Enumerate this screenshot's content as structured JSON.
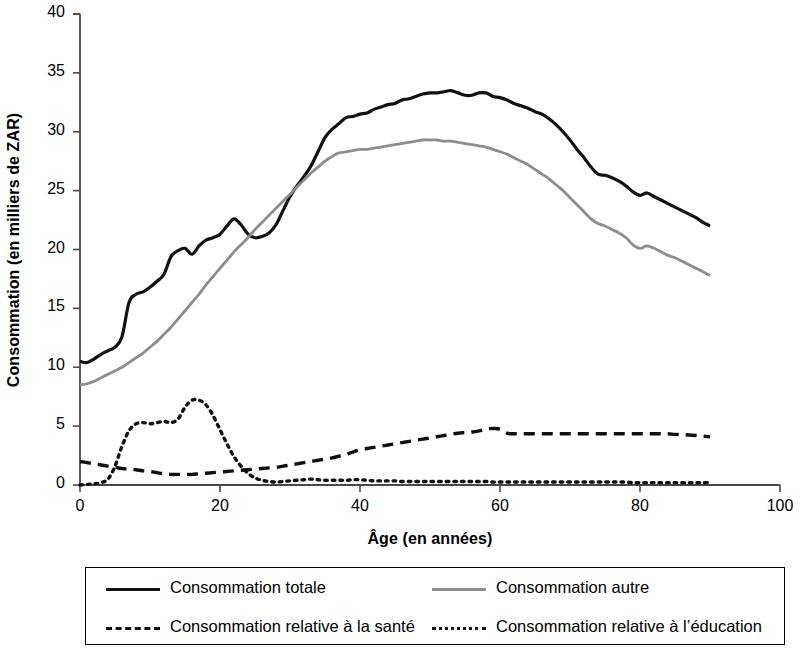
{
  "chart_data": {
    "type": "line",
    "title": "",
    "xlabel": "Âge (en années)",
    "ylabel": "Consommation (en milliers de ZAR)",
    "xlim": [
      0,
      100
    ],
    "ylim": [
      0,
      40
    ],
    "xticks": [
      0,
      20,
      40,
      60,
      80,
      100
    ],
    "yticks": [
      0,
      5,
      10,
      15,
      20,
      25,
      30,
      35,
      40
    ],
    "xtick_labels": [
      "0",
      "20",
      "40",
      "60",
      "80",
      "100"
    ],
    "ytick_labels": [
      "0",
      "5",
      "10",
      "15",
      "20",
      "25",
      "30",
      "35",
      "40"
    ],
    "grid": false,
    "legend_position": "below-axes",
    "x": [
      0,
      1,
      2,
      3,
      4,
      5,
      6,
      7,
      8,
      9,
      10,
      11,
      12,
      13,
      14,
      15,
      16,
      17,
      18,
      19,
      20,
      21,
      22,
      23,
      24,
      25,
      26,
      27,
      28,
      29,
      30,
      31,
      32,
      33,
      34,
      35,
      36,
      37,
      38,
      39,
      40,
      41,
      42,
      43,
      44,
      45,
      46,
      47,
      48,
      49,
      50,
      51,
      52,
      53,
      54,
      55,
      56,
      57,
      58,
      59,
      60,
      61,
      62,
      63,
      64,
      65,
      66,
      67,
      68,
      69,
      70,
      71,
      72,
      73,
      74,
      75,
      76,
      77,
      78,
      79,
      80,
      81,
      82,
      83,
      84,
      85,
      86,
      87,
      88,
      89,
      90
    ],
    "series": [
      {
        "name": "Consommation totale",
        "style": "solid",
        "color": "#111111",
        "values": [
          10.5,
          10.4,
          10.7,
          11.1,
          11.4,
          11.7,
          12.6,
          15.5,
          16.2,
          16.4,
          16.8,
          17.3,
          17.9,
          19.4,
          19.9,
          20.1,
          19.6,
          20.3,
          20.8,
          21.0,
          21.3,
          22.0,
          22.6,
          22.1,
          21.3,
          21.0,
          21.1,
          21.4,
          22.1,
          23.3,
          24.5,
          25.4,
          26.2,
          27.1,
          28.3,
          29.5,
          30.2,
          30.7,
          31.2,
          31.3,
          31.5,
          31.6,
          31.9,
          32.1,
          32.3,
          32.4,
          32.7,
          32.8,
          33.0,
          33.2,
          33.3,
          33.3,
          33.4,
          33.5,
          33.3,
          33.1,
          33.1,
          33.3,
          33.3,
          33.0,
          32.9,
          32.7,
          32.4,
          32.2,
          32.0,
          31.7,
          31.5,
          31.1,
          30.6,
          30.0,
          29.3,
          28.5,
          27.8,
          27.0,
          26.4,
          26.3,
          26.1,
          25.8,
          25.4,
          24.9,
          24.6,
          24.8,
          24.5,
          24.2,
          23.9,
          23.6,
          23.3,
          23.0,
          22.7,
          22.3,
          22.0
        ]
      },
      {
        "name": "Consommation autre",
        "style": "solid",
        "color": "#8d8d8d",
        "values": [
          8.5,
          8.6,
          8.8,
          9.1,
          9.4,
          9.7,
          10.0,
          10.4,
          10.8,
          11.2,
          11.7,
          12.2,
          12.8,
          13.4,
          14.1,
          14.8,
          15.5,
          16.2,
          17.0,
          17.7,
          18.4,
          19.1,
          19.8,
          20.4,
          21.0,
          21.7,
          22.3,
          22.9,
          23.5,
          24.1,
          24.7,
          25.3,
          25.9,
          26.5,
          27.0,
          27.5,
          27.9,
          28.2,
          28.3,
          28.4,
          28.5,
          28.5,
          28.6,
          28.7,
          28.8,
          28.9,
          29.0,
          29.1,
          29.2,
          29.3,
          29.3,
          29.3,
          29.2,
          29.2,
          29.1,
          29.0,
          28.9,
          28.8,
          28.7,
          28.5,
          28.3,
          28.1,
          27.8,
          27.5,
          27.2,
          26.8,
          26.4,
          26.0,
          25.5,
          25.0,
          24.4,
          23.8,
          23.2,
          22.6,
          22.2,
          22.0,
          21.7,
          21.4,
          21.0,
          20.4,
          20.1,
          20.3,
          20.1,
          19.8,
          19.5,
          19.3,
          19.0,
          18.7,
          18.4,
          18.1,
          17.8
        ]
      },
      {
        "name": "Consommation relative à la santé",
        "style": "dashed",
        "color": "#111111",
        "values": [
          2.0,
          1.9,
          1.8,
          1.7,
          1.6,
          1.5,
          1.4,
          1.35,
          1.3,
          1.2,
          1.15,
          1.05,
          0.95,
          0.9,
          0.9,
          0.9,
          0.9,
          0.95,
          1.0,
          1.05,
          1.1,
          1.15,
          1.2,
          1.25,
          1.3,
          1.35,
          1.4,
          1.45,
          1.5,
          1.6,
          1.7,
          1.8,
          1.9,
          2.0,
          2.1,
          2.2,
          2.3,
          2.45,
          2.6,
          2.8,
          3.0,
          3.1,
          3.2,
          3.3,
          3.4,
          3.5,
          3.6,
          3.7,
          3.8,
          3.9,
          4.0,
          4.1,
          4.2,
          4.3,
          4.4,
          4.45,
          4.5,
          4.6,
          4.75,
          4.8,
          4.75,
          4.4,
          4.35,
          4.35,
          4.35,
          4.35,
          4.35,
          4.35,
          4.35,
          4.35,
          4.35,
          4.35,
          4.35,
          4.35,
          4.35,
          4.35,
          4.35,
          4.35,
          4.35,
          4.35,
          4.35,
          4.35,
          4.35,
          4.35,
          4.35,
          4.3,
          4.3,
          4.25,
          4.2,
          4.15,
          4.1
        ]
      },
      {
        "name": "Consommation relative à l’éducation",
        "style": "dotted",
        "color": "#111111",
        "values": [
          0.0,
          0.05,
          0.1,
          0.2,
          0.5,
          1.6,
          3.3,
          4.6,
          5.2,
          5.3,
          5.2,
          5.3,
          5.4,
          5.3,
          5.6,
          6.6,
          7.2,
          7.2,
          6.8,
          5.9,
          4.7,
          3.5,
          2.4,
          1.6,
          1.0,
          0.6,
          0.4,
          0.3,
          0.25,
          0.3,
          0.35,
          0.4,
          0.45,
          0.5,
          0.45,
          0.4,
          0.4,
          0.4,
          0.4,
          0.45,
          0.45,
          0.4,
          0.35,
          0.35,
          0.35,
          0.35,
          0.3,
          0.3,
          0.3,
          0.3,
          0.3,
          0.3,
          0.3,
          0.3,
          0.3,
          0.3,
          0.3,
          0.3,
          0.3,
          0.25,
          0.25,
          0.25,
          0.25,
          0.25,
          0.25,
          0.25,
          0.25,
          0.25,
          0.25,
          0.25,
          0.25,
          0.25,
          0.25,
          0.25,
          0.25,
          0.25,
          0.25,
          0.25,
          0.25,
          0.2,
          0.2,
          0.2,
          0.2,
          0.2,
          0.2,
          0.2,
          0.2,
          0.2,
          0.2,
          0.2,
          0.2
        ]
      }
    ]
  },
  "axes": {
    "xlabel": "Âge (en années)",
    "ylabel": "Consommation (en milliers de ZAR)"
  },
  "legend": {
    "items": [
      {
        "label": "Consommation totale",
        "style": "solid",
        "color": "#111111"
      },
      {
        "label": "Consommation autre",
        "style": "solid",
        "color": "#8d8d8d"
      },
      {
        "label": "Consommation relative à la santé",
        "style": "dashed",
        "color": "#111111"
      },
      {
        "label": "Consommation relative à l’éducation",
        "style": "dotted",
        "color": "#111111"
      }
    ]
  }
}
